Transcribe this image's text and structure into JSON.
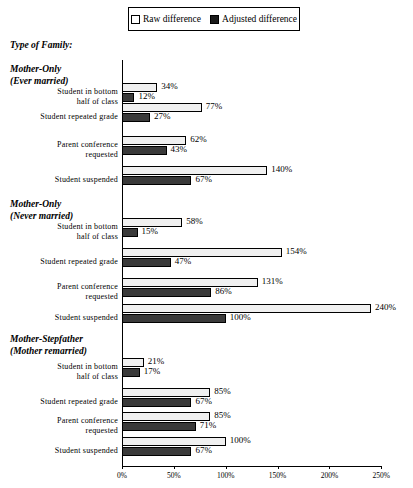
{
  "legend": {
    "entries": [
      {
        "label": "Raw difference",
        "swatch": "raw",
        "color": "#ffffff"
      },
      {
        "label": "Adjusted difference",
        "swatch": "adjusted",
        "color": "#1a1a1a"
      }
    ]
  },
  "header": {
    "family_label": "Type of Family:"
  },
  "axis": {
    "ticks": [
      "0%",
      "50%",
      "100%",
      "150%",
      "200%",
      "250%"
    ],
    "tick_values": [
      0,
      50,
      100,
      150,
      200,
      250
    ]
  },
  "chart_data": {
    "type": "bar",
    "orientation": "horizontal",
    "title": "",
    "xlabel": "",
    "ylabel": "Type of Family:",
    "xlim": [
      0,
      250
    ],
    "grid": false,
    "legend_position": "top",
    "tick_labels": [
      "0%",
      "50%",
      "100%",
      "150%",
      "200%",
      "250%"
    ],
    "series": [
      {
        "name": "Raw difference",
        "color": "#f0f0f0"
      },
      {
        "name": "Adjusted difference",
        "color": "#3a3a3a"
      }
    ],
    "groups": [
      {
        "name": "Mother-Only",
        "subtitle": "(Ever married)",
        "categories": [
          {
            "label_line1": "Student in bottom",
            "label_line2": "half of class",
            "raw": 34,
            "adjusted": 12,
            "raw_text": "34%",
            "adjusted_text": "12%"
          },
          {
            "label_line1": "Student repeated grade",
            "label_line2": "",
            "raw": 77,
            "adjusted": 27,
            "raw_text": "77%",
            "adjusted_text": "27%"
          },
          {
            "label_line1": "Parent conference",
            "label_line2": "requested",
            "raw": 62,
            "adjusted": 43,
            "raw_text": "62%",
            "adjusted_text": "43%"
          },
          {
            "label_line1": "Student suspended",
            "label_line2": "",
            "raw": 140,
            "adjusted": 67,
            "raw_text": "140%",
            "adjusted_text": "67%"
          }
        ]
      },
      {
        "name": "Mother-Only",
        "subtitle": "(Never married)",
        "categories": [
          {
            "label_line1": "Student in bottom",
            "label_line2": "half of class",
            "raw": 58,
            "adjusted": 15,
            "raw_text": "58%",
            "adjusted_text": "15%"
          },
          {
            "label_line1": "Student repeated grade",
            "label_line2": "",
            "raw": 154,
            "adjusted": 47,
            "raw_text": "154%",
            "adjusted_text": "47%"
          },
          {
            "label_line1": "Parent conference",
            "label_line2": "requested",
            "raw": 131,
            "adjusted": 86,
            "raw_text": "131%",
            "adjusted_text": "86%"
          },
          {
            "label_line1": "Student suspended",
            "label_line2": "",
            "raw": 240,
            "adjusted": 100,
            "raw_text": "240%",
            "adjusted_text": "100%"
          }
        ]
      },
      {
        "name": "Mother-Stepfather",
        "subtitle": "(Mother remarried)",
        "categories": [
          {
            "label_line1": "Student in bottom",
            "label_line2": "half of class",
            "raw": 21,
            "adjusted": 17,
            "raw_text": "21%",
            "adjusted_text": "17%"
          },
          {
            "label_line1": "Student repeated grade",
            "label_line2": "",
            "raw": 85,
            "adjusted": 67,
            "raw_text": "85%",
            "adjusted_text": "67%"
          },
          {
            "label_line1": "Parent conference",
            "label_line2": "requested",
            "raw": 85,
            "adjusted": 71,
            "raw_text": "85%",
            "adjusted_text": "71%"
          },
          {
            "label_line1": "Student suspended",
            "label_line2": "",
            "raw": 100,
            "adjusted": 67,
            "raw_text": "100%",
            "adjusted_text": "67%"
          }
        ]
      }
    ]
  }
}
